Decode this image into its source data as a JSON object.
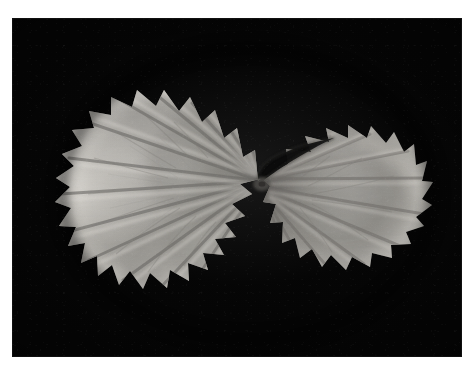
{
  "page": {
    "background_color": "#ffffff",
    "width": 472,
    "height": 384,
    "type": "photograph",
    "caption": ""
  },
  "photo": {
    "name": "leaf-photograph",
    "subject": "geranium leaf",
    "description": "Black and white photograph of a single rounded Pelargonium (geranium) leaf seen from above on a black background",
    "background_color": "#050505",
    "frame": {
      "left": 12,
      "top": 18,
      "width": 450,
      "height": 339
    },
    "border_color": "#ffffff"
  },
  "leaf": {
    "name": "geranium-leaf",
    "common_name": "geranium leaf",
    "shape": "orbicular, palmately lobed, crenate margin",
    "center_point": {
      "x": 256,
      "y": 167
    },
    "bounds": {
      "x": 76,
      "y": 20,
      "width": 330,
      "height": 298
    },
    "tone_light": "#d8d6d2",
    "tone_mid": "#a9a7a3",
    "tone_dark": "#6e6c69",
    "tone_shadow": "#3c3a38",
    "vein_count": 13,
    "scallop_count": 34,
    "sinus": {
      "name": "leaf-sinus",
      "description": "dark wedge-shaped notch opening up and to the right of the leaf centre"
    },
    "zone_band": {
      "name": "zonal-marking",
      "description": "darker horseshoe-shaped zone band across the middle of the blade"
    }
  }
}
